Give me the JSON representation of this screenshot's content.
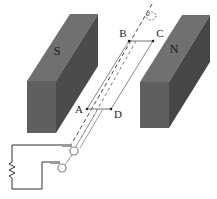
{
  "diagram": {
    "type": "generator-coil-in-magnetic-field",
    "magnets": [
      {
        "id": "south",
        "label": "S",
        "colors": {
          "top": "#6f6f6f",
          "front": "#5e5e5e",
          "side": "#4a4a4a"
        }
      },
      {
        "id": "north",
        "label": "N",
        "colors": {
          "top": "#6f6f6f",
          "front": "#5e5e5e",
          "side": "#454545"
        }
      }
    ],
    "coil": {
      "corners": [
        {
          "label": "A"
        },
        {
          "label": "B"
        },
        {
          "label": "C"
        },
        {
          "label": "D"
        }
      ]
    },
    "axis": {
      "style": "dashed",
      "rotation_indicator": "circular-arrow"
    },
    "circuit": {
      "components": [
        "slip-ring",
        "slip-ring",
        "brush",
        "brush",
        "resistor"
      ]
    }
  }
}
